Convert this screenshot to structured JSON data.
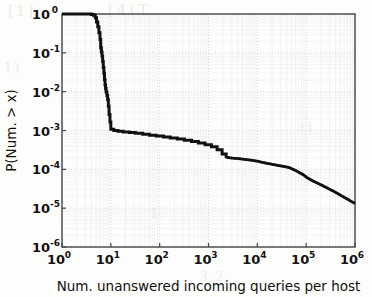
{
  "figure": {
    "background_color": "#fdfdfb",
    "ink_color": "#111111",
    "grid_color": "#cccccc",
    "frame_color": "#444444"
  },
  "ghost_text": {
    "a": "[1]",
    "b": "[4(T",
    "c": "1)",
    "d": "1.",
    "e": "()",
    "f": "3.2."
  },
  "chart_data": {
    "type": "line",
    "title": "",
    "subtitle": "",
    "xlabel": "Num. unanswered incoming queries per host",
    "ylabel": "P(Num. > x)",
    "xscale": "log",
    "yscale": "log",
    "xlim": [
      1,
      1000000
    ],
    "ylim": [
      1e-06,
      1
    ],
    "grid": true,
    "legend": null,
    "legend_position": "none",
    "xticks": [
      {
        "value": 1,
        "label": "10",
        "exponent": "0"
      },
      {
        "value": 10,
        "label": "10",
        "exponent": "1"
      },
      {
        "value": 100,
        "label": "10",
        "exponent": "2"
      },
      {
        "value": 1000,
        "label": "10",
        "exponent": "3"
      },
      {
        "value": 10000,
        "label": "10",
        "exponent": "4"
      },
      {
        "value": 100000,
        "label": "10",
        "exponent": "5"
      },
      {
        "value": 1000000,
        "label": "10",
        "exponent": "6"
      }
    ],
    "yticks": [
      {
        "value": 1,
        "label": "10",
        "exponent": "0"
      },
      {
        "value": 0.1,
        "label": "10",
        "exponent": "-1"
      },
      {
        "value": 0.01,
        "label": "10",
        "exponent": "-2"
      },
      {
        "value": 0.001,
        "label": "10",
        "exponent": "-3"
      },
      {
        "value": 0.0001,
        "label": "10",
        "exponent": "-4"
      },
      {
        "value": 1e-05,
        "label": "10",
        "exponent": "-5"
      },
      {
        "value": 1e-06,
        "label": "10",
        "exponent": "-6"
      }
    ],
    "series": [
      {
        "name": "CCDF of unanswered incoming queries per host",
        "style": "step-then-scatter",
        "color": "#111111",
        "linewidth": 3.0,
        "points": [
          [
            1.0,
            1.0
          ],
          [
            3.4,
            1.0
          ],
          [
            4.0,
            0.97
          ],
          [
            4.4,
            0.93
          ],
          [
            4.8,
            0.8
          ],
          [
            5.1,
            0.62
          ],
          [
            5.4,
            0.47
          ],
          [
            5.7,
            0.33
          ],
          [
            6.0,
            0.22
          ],
          [
            6.2,
            0.135
          ],
          [
            6.4,
            0.105
          ],
          [
            6.6,
            0.082
          ],
          [
            6.8,
            0.06
          ],
          [
            7.0,
            0.042
          ],
          [
            7.2,
            0.03
          ],
          [
            7.4,
            0.0205
          ],
          [
            7.6,
            0.015
          ],
          [
            7.8,
            0.012
          ],
          [
            8.0,
            0.0098
          ],
          [
            8.3,
            0.008
          ],
          [
            8.6,
            0.0062
          ],
          [
            8.9,
            0.0042
          ],
          [
            9.2,
            0.0026
          ],
          [
            9.6,
            0.00165
          ],
          [
            10.0,
            0.00108
          ],
          [
            11.5,
            0.001
          ],
          [
            14.0,
            0.00096
          ],
          [
            18.0,
            0.00092
          ],
          [
            24.0,
            0.00089
          ],
          [
            32.0,
            0.00085
          ],
          [
            45.0,
            0.0008
          ],
          [
            62.0,
            0.00076
          ],
          [
            85.0,
            0.00072
          ],
          [
            120.0,
            0.00068
          ],
          [
            165.0,
            0.00064
          ],
          [
            230.0,
            0.0006
          ],
          [
            320.0,
            0.00056
          ],
          [
            450.0,
            0.00052
          ],
          [
            620.0,
            0.00048
          ],
          [
            850.0,
            0.00043
          ],
          [
            1150.0,
            0.00038
          ],
          [
            1500.0,
            0.00032
          ],
          [
            1900.0,
            0.00025
          ],
          [
            2300.0,
            0.000205
          ],
          [
            3000.0,
            0.000195
          ],
          [
            4200.0,
            0.000188
          ],
          [
            5600.0,
            0.00018
          ],
          [
            7500.0,
            0.000172
          ],
          [
            10000.0,
            0.000162
          ],
          [
            13000.0,
            0.00015
          ],
          [
            17000.0,
            0.00014
          ],
          [
            22000.0,
            0.000132
          ],
          [
            28000.0,
            0.000124
          ],
          [
            36000.0,
            0.000118
          ],
          [
            46000.0,
            0.00011
          ],
          [
            58000.0,
            9.6e-05
          ],
          [
            72000.0,
            8.3e-05
          ],
          [
            88000.0,
            7.2e-05
          ],
          [
            105000.0,
            6.1e-05
          ],
          [
            130000.0,
            5.2e-05
          ],
          [
            165000.0,
            4.5e-05
          ],
          [
            210000.0,
            3.9e-05
          ],
          [
            270000.0,
            3.3e-05
          ],
          [
            350000.0,
            2.8e-05
          ],
          [
            450000.0,
            2.35e-05
          ],
          [
            580000.0,
            1.95e-05
          ],
          [
            750000.0,
            1.62e-05
          ],
          [
            1000000.0,
            1.32e-05
          ]
        ]
      }
    ],
    "annotations": []
  }
}
